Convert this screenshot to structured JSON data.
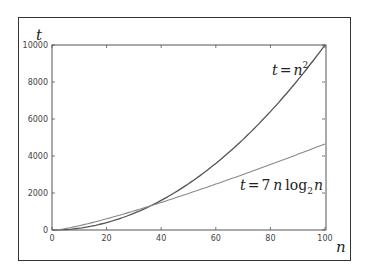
{
  "chart_data": {
    "type": "line",
    "title": "",
    "xlabel": "n",
    "ylabel": "t",
    "xlim": [
      0,
      100
    ],
    "ylim": [
      0,
      10000
    ],
    "grid": false,
    "legend": "none",
    "x_ticks": [
      "0",
      "20",
      "40",
      "60",
      "80",
      "100"
    ],
    "y_ticks": [
      "0",
      "2000",
      "4000",
      "6000",
      "8000",
      "10000"
    ],
    "series": [
      {
        "name": "t = n^2",
        "x": [
          0,
          10,
          20,
          30,
          36,
          40,
          50,
          60,
          70,
          80,
          90,
          100
        ],
        "values": [
          0,
          100,
          400,
          900,
          1296,
          1600,
          2500,
          3600,
          4900,
          6400,
          8100,
          10000
        ]
      },
      {
        "name": "t = 7 n log2 n",
        "x": [
          1,
          10,
          20,
          30,
          36,
          40,
          50,
          60,
          70,
          80,
          90,
          100
        ],
        "values": [
          0,
          233,
          605,
          1030,
          1303,
          1490,
          1975,
          2481,
          3005,
          3542,
          4091,
          4651
        ]
      }
    ],
    "annotations": [
      {
        "text": "t = n^2",
        "near": [
          80,
          8400
        ]
      },
      {
        "text": "t = 7 n log2 n",
        "near": [
          85,
          2200
        ]
      }
    ]
  },
  "labels": {
    "y_axis": "t",
    "x_axis": "n",
    "curve1_lhs": "t",
    "curve1_eq": "=",
    "curve1_base": "n",
    "curve1_exp": "2",
    "curve2_lhs": "t",
    "curve2_eq": "=",
    "curve2_coef": "7",
    "curve2_n": "n",
    "curve2_log": "log",
    "curve2_sub": "2",
    "curve2_arg": "n"
  }
}
